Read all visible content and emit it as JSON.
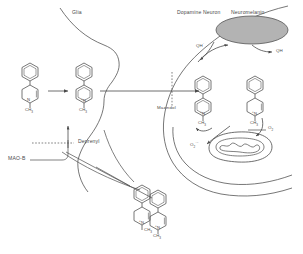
{
  "figure": {
    "type": "biochemical-pathway-diagram"
  },
  "compartments": {
    "glia": {
      "label": "Glia"
    },
    "neuron": {
      "label": "Dopamine Neuron"
    },
    "neuromelanin": {
      "label": "Neuromelanin",
      "fill": "#b3b3b3"
    },
    "mitochondrion": {
      "label": ""
    }
  },
  "labels": {
    "glia": "Glia",
    "dopamine_neuron": "Dopamine Neuron",
    "neuromelanin": "Neuromelanin",
    "mazindol": "Mazindol",
    "deprenyl": "Deprenyl",
    "mao_b": "MAO-B",
    "qh_radical": "QH",
    "qh_radical_dot": "·",
    "qh": "QH",
    "o2": "O",
    "o2_sub": "2",
    "o2_radical": "O",
    "o2_radical_sub": "2",
    "o2_radical_sup": "·−"
  },
  "molecules": {
    "mptp_glia": {
      "name": "MPTP",
      "n_label": "N",
      "methyl": "CH",
      "methyl_sub": "3",
      "charge": ""
    },
    "mpdp_glia": {
      "name": "MPDP+",
      "n_label": "N",
      "methyl": "CH",
      "methyl_sub": "3",
      "charge": "+"
    },
    "mpp_bottom": {
      "name": "MPP+",
      "n_label": "N",
      "methyl": "CH",
      "methyl_sub": "3",
      "charge": "+"
    },
    "mpp_neuron_left": {
      "name": "MPP+",
      "n_label": "N",
      "methyl": "CH",
      "methyl_sub": "3",
      "charge": "+"
    },
    "mpp_neuron_right": {
      "name": "MPP+",
      "n_label": "N",
      "methyl": "CH",
      "methyl_sub": "3",
      "charge": "+"
    },
    "mpp_lower_left": {
      "name": "MPP+",
      "n_label": "N",
      "methyl": "CH",
      "methyl_sub": "3",
      "charge": "+"
    }
  },
  "colors": {
    "stroke": "#4a4a4a",
    "text": "#4a4a4a",
    "neuromelanin_fill": "#b3b3b3",
    "background": "#ffffff"
  }
}
